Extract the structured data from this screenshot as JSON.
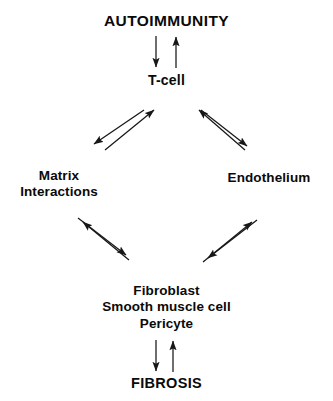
{
  "diagram": {
    "nodes": {
      "autoimmunity": {
        "label": "AUTOIMMUNITY"
      },
      "tcell": {
        "label": "T-cell"
      },
      "matrix": {
        "line1": "Matrix",
        "line2": "Interactions"
      },
      "endothelium": {
        "label": "Endothelium"
      },
      "effector_cells": {
        "line1": "Fibroblast",
        "line2": "Smooth muscle cell",
        "line3": "Pericyte"
      },
      "fibrosis": {
        "label": "FIBROSIS"
      }
    },
    "connections": [
      {
        "id": "autoimmunity-to-tcell",
        "from": "AUTOIMMUNITY",
        "to": "T-cell",
        "direction": "down"
      },
      {
        "id": "tcell-to-autoimmunity",
        "from": "T-cell",
        "to": "AUTOIMMUNITY",
        "direction": "up"
      },
      {
        "id": "tcell-to-matrix",
        "from": "T-cell",
        "to": "Matrix Interactions",
        "direction": "down-left"
      },
      {
        "id": "matrix-to-tcell",
        "from": "Matrix Interactions",
        "to": "T-cell",
        "direction": "up-right"
      },
      {
        "id": "tcell-to-endothelium",
        "from": "T-cell",
        "to": "Endothelium",
        "direction": "down-right"
      },
      {
        "id": "endothelium-to-tcell",
        "from": "Endothelium",
        "to": "T-cell",
        "direction": "up-left"
      },
      {
        "id": "matrix-to-effector",
        "from": "Matrix Interactions",
        "to": "Fibroblast Smooth muscle cell Pericyte",
        "direction": "down-right"
      },
      {
        "id": "effector-to-matrix",
        "from": "Fibroblast Smooth muscle cell Pericyte",
        "to": "Matrix Interactions",
        "direction": "up-left"
      },
      {
        "id": "endothelium-to-effector",
        "from": "Endothelium",
        "to": "Fibroblast Smooth muscle cell Pericyte",
        "direction": "down-left"
      },
      {
        "id": "effector-to-endothelium",
        "from": "Fibroblast Smooth muscle cell Pericyte",
        "to": "Endothelium",
        "direction": "up-right"
      },
      {
        "id": "effector-to-fibrosis",
        "from": "Pericyte",
        "to": "FIBROSIS",
        "direction": "down"
      },
      {
        "id": "fibrosis-to-effector",
        "from": "FIBROSIS",
        "to": "Pericyte",
        "direction": "up"
      }
    ],
    "colors": {
      "background": "#ffffff",
      "text": "#0a0a0a",
      "arrow": "#171717"
    }
  }
}
